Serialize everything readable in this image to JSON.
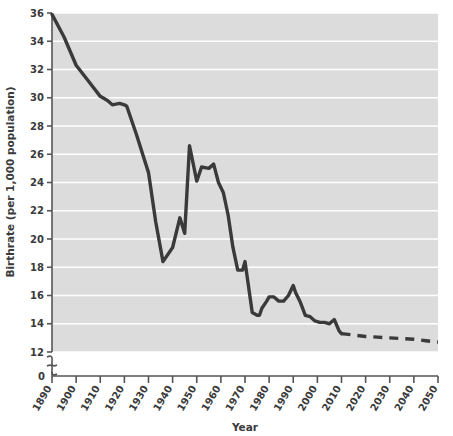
{
  "chart_data": {
    "type": "line",
    "title": "",
    "xlabel": "Year",
    "ylabel": "Birthrate (per 1,000 population)",
    "xlim": [
      1890,
      2050
    ],
    "ylim": [
      12,
      36
    ],
    "y_axis_break": true,
    "y_axis_break_note": "axis broken between 0 and 12",
    "grid": "horizontal white gridlines",
    "legend": "none",
    "xticks": [
      "1890",
      "1900",
      "1910",
      "1920",
      "1930",
      "1940",
      "1950",
      "1960",
      "1970",
      "1980",
      "1990",
      "2000",
      "2010",
      "2020",
      "2030",
      "2040",
      "2050"
    ],
    "yticks": [
      "0",
      "12",
      "14",
      "16",
      "18",
      "20",
      "22",
      "24",
      "26",
      "28",
      "30",
      "32",
      "34",
      "36"
    ],
    "colors": {
      "line": "#3a3a3a",
      "plot_background": "#dcdcdc",
      "gridline": "#ffffff",
      "axis": "#555555",
      "page_background": "#ffffff"
    },
    "series": [
      {
        "name": "Historical birthrate",
        "style": "solid",
        "x": [
          1890,
          1895,
          1900,
          1905,
          1910,
          1913,
          1915,
          1918,
          1920,
          1921,
          1925,
          1930,
          1933,
          1936,
          1940,
          1943,
          1945,
          1947,
          1950,
          1952,
          1955,
          1957,
          1959,
          1961,
          1963,
          1965,
          1967,
          1969,
          1970,
          1971,
          1973,
          1975,
          1976,
          1977,
          1979,
          1980,
          1982,
          1984,
          1986,
          1988,
          1990,
          1991,
          1993,
          1995,
          1997,
          1999,
          2001,
          2003,
          2005,
          2007,
          2009,
          2010
        ],
        "y": [
          35.9,
          34.3,
          32.3,
          31.2,
          30.1,
          29.8,
          29.5,
          29.6,
          29.5,
          29.4,
          27.4,
          24.7,
          21.2,
          18.4,
          19.4,
          21.5,
          20.4,
          26.6,
          24.1,
          25.1,
          25.0,
          25.3,
          24.0,
          23.3,
          21.7,
          19.4,
          17.8,
          17.8,
          18.4,
          17.2,
          14.8,
          14.6,
          14.6,
          15.1,
          15.6,
          15.9,
          15.9,
          15.6,
          15.6,
          16.0,
          16.7,
          16.2,
          15.5,
          14.6,
          14.5,
          14.2,
          14.1,
          14.1,
          14.0,
          14.3,
          13.5,
          13.3
        ]
      },
      {
        "name": "Projected birthrate",
        "style": "dashed",
        "x": [
          2010,
          2015,
          2020,
          2025,
          2030,
          2035,
          2040,
          2045,
          2050
        ],
        "y": [
          13.3,
          13.2,
          13.1,
          13.05,
          13.0,
          12.95,
          12.9,
          12.8,
          12.7
        ]
      }
    ]
  },
  "axes": {
    "x_title": "Year",
    "y_title": "Birthrate (per 1,000 population)",
    "y_zero_label": "0",
    "y_labels": [
      "36",
      "34",
      "32",
      "30",
      "28",
      "26",
      "24",
      "22",
      "20",
      "18",
      "16",
      "14",
      "12"
    ],
    "x_labels": [
      "1890",
      "1900",
      "1910",
      "1920",
      "1930",
      "1940",
      "1950",
      "1960",
      "1970",
      "1980",
      "1990",
      "2000",
      "2010",
      "2020",
      "2030",
      "2040",
      "2050"
    ]
  }
}
